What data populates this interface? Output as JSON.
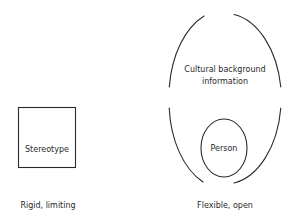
{
  "left_panel": {
    "box_label": "Stereotype",
    "caption": "Rigid, limiting"
  },
  "right_panel": {
    "outer_label_line1": "Cultural background",
    "outer_label_line2": "information",
    "inner_label": "Person",
    "caption": "Flexible, open"
  },
  "colors": {
    "stroke": "#2a2a2a",
    "background": "#ffffff"
  }
}
